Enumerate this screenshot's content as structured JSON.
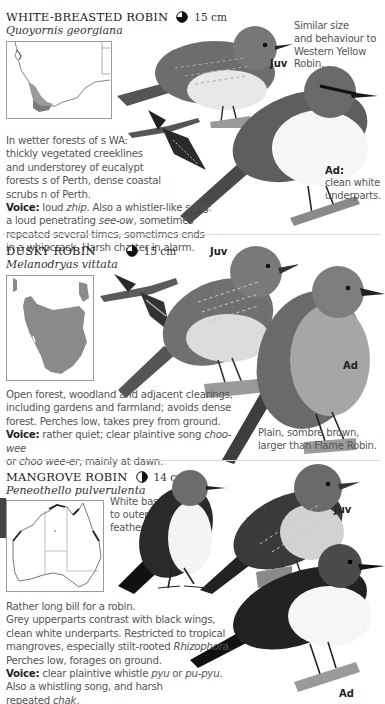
{
  "page": {
    "type": "field-guide-page",
    "palette": {
      "text": "#555555",
      "heading": "#1a1a1a",
      "map_fill": "#8a8a8a",
      "divider": "#d9d9d9"
    }
  },
  "species": [
    {
      "common_name": "WHITE-BREASTED ROBIN",
      "scientific_name": "Quoyornis georgiana",
      "size": "15 cm",
      "size_icon": "pie-three-quarter-icon",
      "side_note": [
        "Similar size",
        "and behaviour to",
        "Western Yellow",
        "Robin."
      ],
      "description": [
        {
          "t": "In wetter forests of s WA:"
        },
        {
          "t": "thickly vegetated creeklines"
        },
        {
          "t": "and understorey of eucalypt"
        },
        {
          "t": "forests s of Perth, dense coastal"
        },
        {
          "t": "scrubs n of Perth."
        }
      ],
      "voice_label": "Voice:",
      "voice_lines": [
        "loud |zhip|. Also a whistler-like song:",
        "a loud penetrating |see-ow|, sometimes",
        "repeated several times, sometimes ends",
        "in a whipcrack. Harsh chatter in alarm."
      ],
      "labels": {
        "juv": "Juv",
        "ad": "Ad:",
        "ad_note": [
          "clean white",
          "underparts."
        ]
      },
      "map_region": "south-western Western Australia"
    },
    {
      "common_name": "DUSKY ROBIN",
      "scientific_name": "Melanodryas vittata",
      "size": "15 cm",
      "size_icon": "pie-three-quarter-icon",
      "description": [
        "Open forest, woodland and adjacent clearings,",
        "including gardens and farmland; avoids dense",
        "forest. Perches low, takes prey from ground."
      ],
      "voice_label": "Voice:",
      "voice_lines": [
        "rather quiet; clear plaintive song |choo-wee|",
        "or |choo wee-er|, mainly at dawn."
      ],
      "labels": {
        "juv": "Juv",
        "ad": "Ad",
        "ad_note": [
          "Plain, sombre brown,",
          "larger than Flame Robin."
        ]
      },
      "map_region": "Tasmania"
    },
    {
      "common_name": "MANGROVE ROBIN",
      "scientific_name": "Peneothello pulverulenta",
      "size": "14 cm",
      "size_icon": "pie-half-icon",
      "side_note": [
        "White bases",
        "to outer tail",
        "feathers."
      ],
      "description": [
        "Rather long bill for a robin.",
        "Grey upperparts contrast with black wings,",
        "clean white underparts. Restricted to tropical",
        "mangroves, especially stilt-rooted |Rhizophora|.",
        "Perches low, forages on ground."
      ],
      "voice_label": "Voice:",
      "voice_lines": [
        "clear plaintive whistle |pyu| or |pu-pyu|.",
        "Also a whistling song, and harsh",
        "repeated |chak|."
      ],
      "labels": {
        "juv": "Juv",
        "ad": "Ad"
      },
      "map_region": "northern Australian coast"
    }
  ]
}
